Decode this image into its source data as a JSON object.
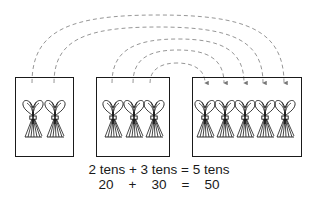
{
  "diagram": {
    "groups": [
      {
        "name": "first-addend",
        "bundles": 2,
        "box": {
          "x": 15,
          "y": 77,
          "w": 59,
          "h": 80
        }
      },
      {
        "name": "second-addend",
        "bundles": 3,
        "box": {
          "x": 96,
          "y": 77,
          "w": 74,
          "h": 80
        }
      },
      {
        "name": "sum",
        "bundles": 5,
        "box": {
          "x": 192,
          "y": 77,
          "w": 110,
          "h": 80
        }
      }
    ],
    "arrows": [
      {
        "from_x": 32,
        "to_x": 284,
        "peak_y": 15
      },
      {
        "from_x": 54,
        "to_x": 263,
        "peak_y": 27
      },
      {
        "from_x": 112,
        "to_x": 244,
        "peak_y": 39
      },
      {
        "from_x": 133,
        "to_x": 224,
        "peak_y": 50
      },
      {
        "from_x": 150,
        "to_x": 205,
        "peak_y": 63
      }
    ],
    "colors": {
      "stroke": "#1a1a1a",
      "dashed": "#888888"
    }
  },
  "caption": {
    "words_line": "2 tens + 3 tens = 5 tens",
    "numbers_line": {
      "a": "20",
      "plus": "+",
      "b": "30",
      "eq": "=",
      "c": "50"
    }
  }
}
